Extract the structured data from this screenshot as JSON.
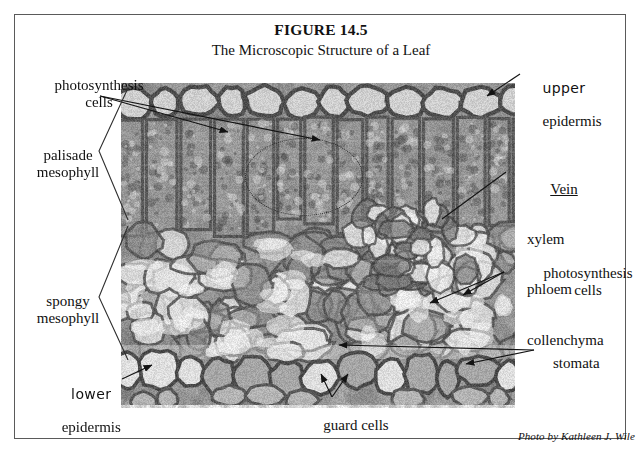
{
  "figure": {
    "number_label": "FIGURE 14.5",
    "title": "The Microscopic Structure of a Leaf",
    "credit": "Photo by Kathleen J. Wile"
  },
  "labels": {
    "photosynthesis_cells_left": "photosynthesis\ncells",
    "palisade_mesophyll": "palisade\nmesophyll",
    "spongy_mesophyll": "spongy\nmesophyll",
    "lower_hand": "lower",
    "lower_serif": "epidermis",
    "upper_hand": "upper",
    "upper_serif": "epidermis",
    "vein_heading": "Vein",
    "vein_items": [
      "xylem",
      "phloem",
      "collenchyma"
    ],
    "photosynthesis_cells_right": "photosynthesis\ncells",
    "stomata": "stomata",
    "guard_cells": "guard cells"
  },
  "image": {
    "alt_name": "leaf-cross-section-micrograph",
    "kind": "grayscale light micrograph",
    "regions": [
      "upper epidermis",
      "palisade mesophyll",
      "spongy mesophyll",
      "vein (xylem, phloem, collenchyma)",
      "lower epidermis",
      "stomata",
      "guard cells"
    ]
  },
  "colors": {
    "frame": "#5a5a5a",
    "text": "#111111",
    "leader": "#1a1a1a",
    "micrograph_mid": "#8f8f8f",
    "micrograph_dark": "#4a4a4a",
    "micrograph_light": "#e2e2e2"
  }
}
